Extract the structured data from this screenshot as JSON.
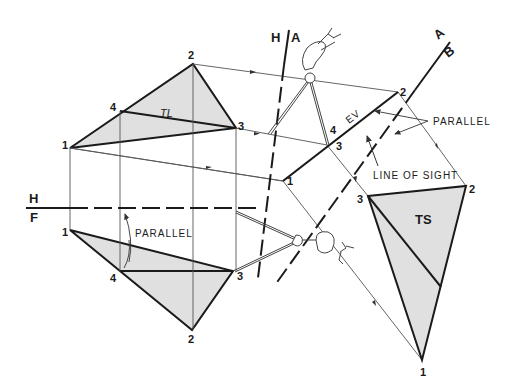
{
  "diagram": {
    "colors": {
      "line": "#1a1a1a",
      "shade": "#e0e0e0",
      "projector": "#555555"
    },
    "fold_lines": {
      "hf": {
        "top": "H",
        "bottom": "F"
      },
      "ha": {
        "left": "H",
        "right": "A"
      },
      "ab": {
        "top": "A",
        "bottom": "B"
      }
    },
    "top_view": {
      "points": {
        "p1": "1",
        "p2": "2",
        "p3": "3",
        "p4": "4"
      },
      "tl_label": "TL"
    },
    "front_view": {
      "points": {
        "p1": "1",
        "p2": "2",
        "p3": "3",
        "p4": "4"
      },
      "parallel_label": "PARALLEL"
    },
    "aux_view_1": {
      "points": {
        "p1": "1",
        "p2": "2",
        "p3": "3",
        "p4": "4"
      },
      "ev_label": "EV",
      "parallel_label": "PARALLEL",
      "line_of_sight_label": "LINE OF SIGHT"
    },
    "aux_view_2": {
      "points": {
        "p1": "1",
        "p2": "2",
        "p3": "3"
      },
      "ts_label": "TS"
    },
    "icons": [
      "hand-with-dividers-icon",
      "hand-with-dividers-icon"
    ]
  }
}
